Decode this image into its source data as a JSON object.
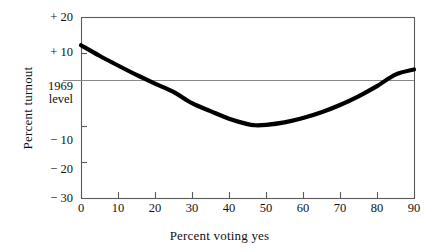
{
  "chart_data": {
    "type": "line",
    "title": "",
    "xlabel": "Percent voting yes",
    "ylabel": "Percent turnout",
    "xlim": [
      0,
      90
    ],
    "ylim": [
      -30,
      20
    ],
    "grid": false,
    "legend": "none",
    "x_ticks": [
      "0",
      "10",
      "20",
      "30",
      "40",
      "50",
      "60",
      "70",
      "80",
      "90"
    ],
    "x_tick_values": [
      0,
      10,
      20,
      30,
      40,
      50,
      60,
      70,
      80,
      90
    ],
    "y_ticks": [
      "+ 20",
      "+ 10",
      "− 10",
      "− 20",
      "− 30"
    ],
    "y_tick_values": [
      20,
      10,
      -10,
      -20,
      -30
    ],
    "reference_line": {
      "label_line1": "1969",
      "label_line2": "level",
      "value": 2.5,
      "color": "#888888"
    },
    "series": [
      {
        "name": "turnout change",
        "color": "#000000",
        "x": [
          0,
          5,
          10,
          15,
          20,
          25,
          30,
          35,
          40,
          45,
          47,
          50,
          55,
          60,
          65,
          70,
          75,
          80,
          85,
          90
        ],
        "values": [
          12.2,
          9.3,
          6.6,
          4.0,
          1.6,
          -0.7,
          -3.8,
          -6.0,
          -8.1,
          -9.6,
          -9.9,
          -9.8,
          -9.1,
          -7.9,
          -6.3,
          -4.3,
          -1.9,
          0.9,
          4.1,
          5.5
        ]
      }
    ],
    "annotations": []
  },
  "figure": {
    "background": "#ffffff",
    "frame_color": "#5a5a5a"
  }
}
